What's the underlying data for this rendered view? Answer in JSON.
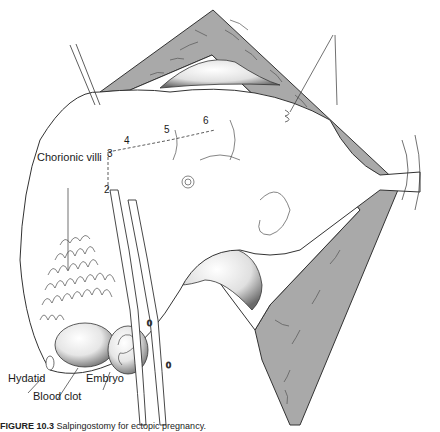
{
  "figure": {
    "type": "surgical-illustration",
    "colors": {
      "retractor_fill": "#a9a9a9",
      "line": "#333333",
      "background": "#ffffff"
    },
    "labels": {
      "chorionic_villi": "Chorionic villi",
      "hydatid": "Hydatid",
      "blood_clot": "Blood clot",
      "embryo": "Embryo"
    },
    "incision_markers": [
      "2",
      "3",
      "4",
      "5",
      "6"
    ],
    "caption": {
      "prefix": "FIGURE 10.3",
      "text": "Salpingostomy for ectopic pregnancy."
    }
  }
}
